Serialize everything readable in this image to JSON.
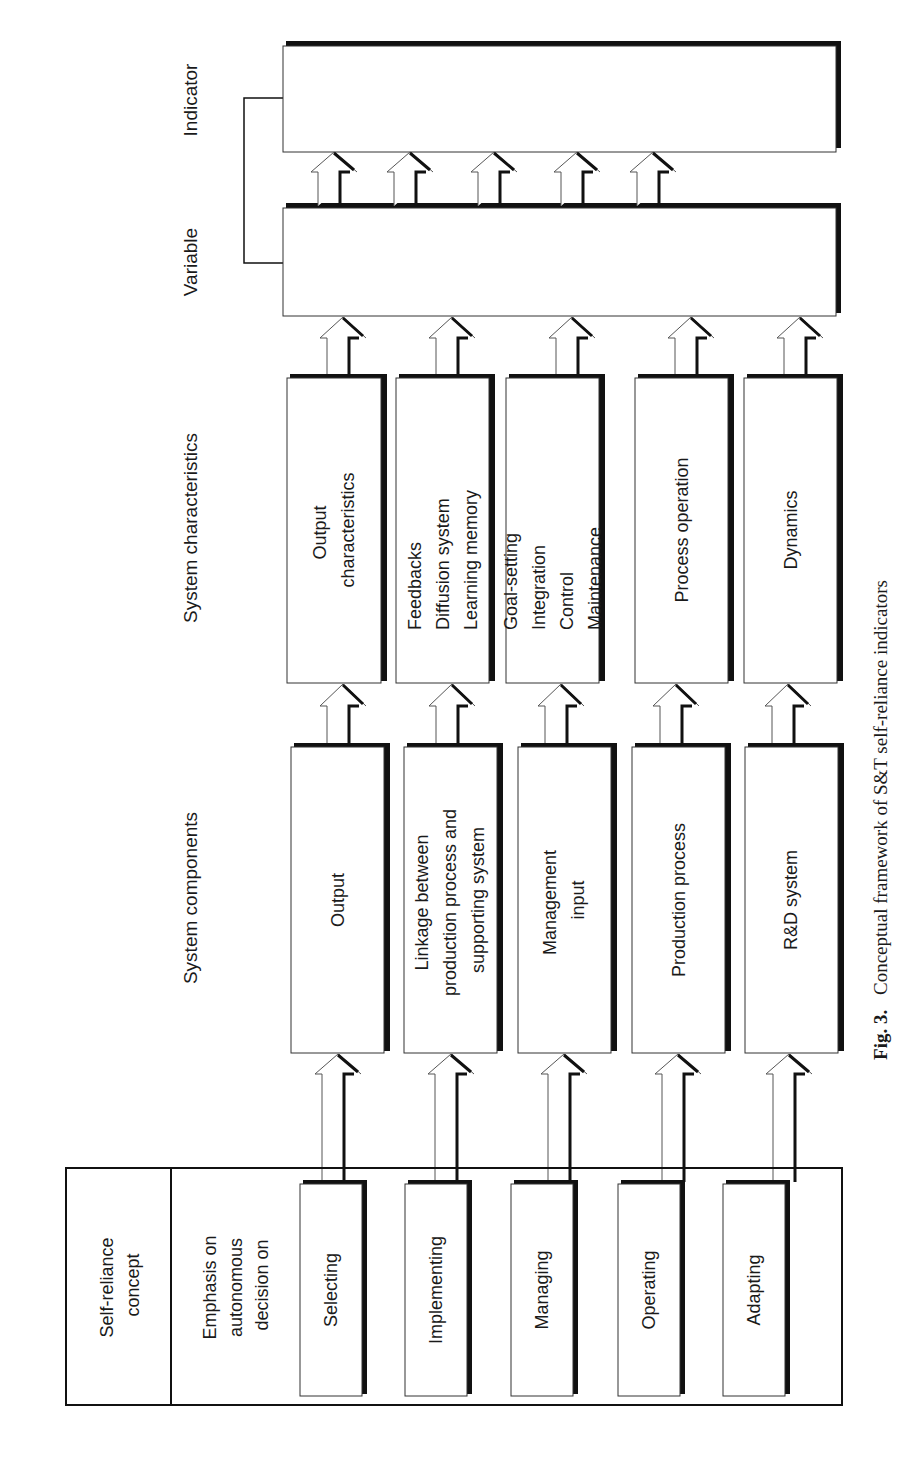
{
  "figure": {
    "orientation": "rotated 90 degrees counter-clockwise",
    "caption_label": "Fig. 3.",
    "caption_text": "Conceptual framework of S&T self-reliance indicators"
  },
  "headers": {
    "indicator": "Indicator",
    "variable": "Variable",
    "system_characteristics": "System characteristics",
    "system_components": "System components"
  },
  "left_table": {
    "title_line1": "Self-reliance",
    "title_line2": "concept",
    "emphasis_line1": "Emphasis on",
    "emphasis_line2": "autonomous",
    "emphasis_line3": "decision on"
  },
  "columns": [
    {
      "decision": "Selecting",
      "component": [
        "Output"
      ],
      "characteristics": [
        "Output",
        "characteristics"
      ]
    },
    {
      "decision": "Implementing",
      "component": [
        "Linkage between",
        "production process and",
        "supporting system"
      ],
      "characteristics": [
        "Feedbacks",
        "Diffusion system",
        "Learning memory"
      ]
    },
    {
      "decision": "Managing",
      "component": [
        "Management",
        "input"
      ],
      "characteristics": [
        "Goal-setting",
        "Integration",
        "Control",
        "Maintenance"
      ]
    },
    {
      "decision": "Operating",
      "component": [
        "Production process"
      ],
      "characteristics": [
        "Process operation"
      ]
    },
    {
      "decision": "Adapting",
      "component": [
        "R&D system"
      ],
      "characteristics": [
        "Dynamics"
      ]
    }
  ]
}
